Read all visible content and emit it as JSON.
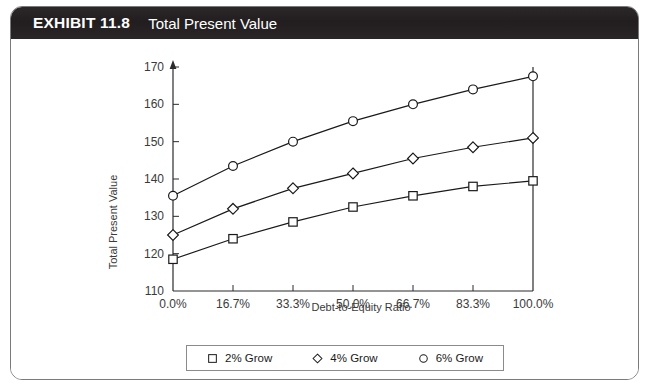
{
  "exhibit": {
    "number": "EXHIBIT 11.8",
    "title": "Total Present Value"
  },
  "chart_data": {
    "type": "line",
    "title": "Total Present Value",
    "xlabel": "Debt-to-Equity Ratio",
    "ylabel": "Total Present Value",
    "categories": [
      "0.0%",
      "16.7%",
      "33.3%",
      "50.0%",
      "66.7%",
      "83.3%",
      "100.0%"
    ],
    "ylim": [
      110,
      170
    ],
    "yticks": [
      110,
      120,
      130,
      140,
      150,
      160,
      170
    ],
    "ytick_labels": [
      "110",
      "120",
      "130",
      "140",
      "150",
      "160",
      "170"
    ],
    "grid": false,
    "legend_position": "bottom",
    "series": [
      {
        "name": "2% Grow",
        "marker": "square",
        "values": [
          118.5,
          124.0,
          128.5,
          132.5,
          135.5,
          138.0,
          139.5
        ]
      },
      {
        "name": "4% Grow",
        "marker": "diamond",
        "values": [
          125.0,
          132.0,
          137.5,
          141.5,
          145.5,
          148.5,
          151.0
        ]
      },
      {
        "name": "6% Grow",
        "marker": "circle",
        "values": [
          135.5,
          143.5,
          150.0,
          155.5,
          160.0,
          164.0,
          167.5
        ]
      }
    ]
  },
  "legend": {
    "entries": [
      {
        "label": "2% Grow",
        "marker": "square-marker"
      },
      {
        "label": "4% Grow",
        "marker": "diamond-marker"
      },
      {
        "label": "6% Grow",
        "marker": "circle-marker"
      }
    ]
  },
  "colors": {
    "header_background": "#231f20",
    "header_text": "#ffffff",
    "frame_border": "#7a7a7a",
    "axis": "#2b2b2b",
    "series_line": "#1a1a1a",
    "tick_label": "#3a3a3a"
  }
}
